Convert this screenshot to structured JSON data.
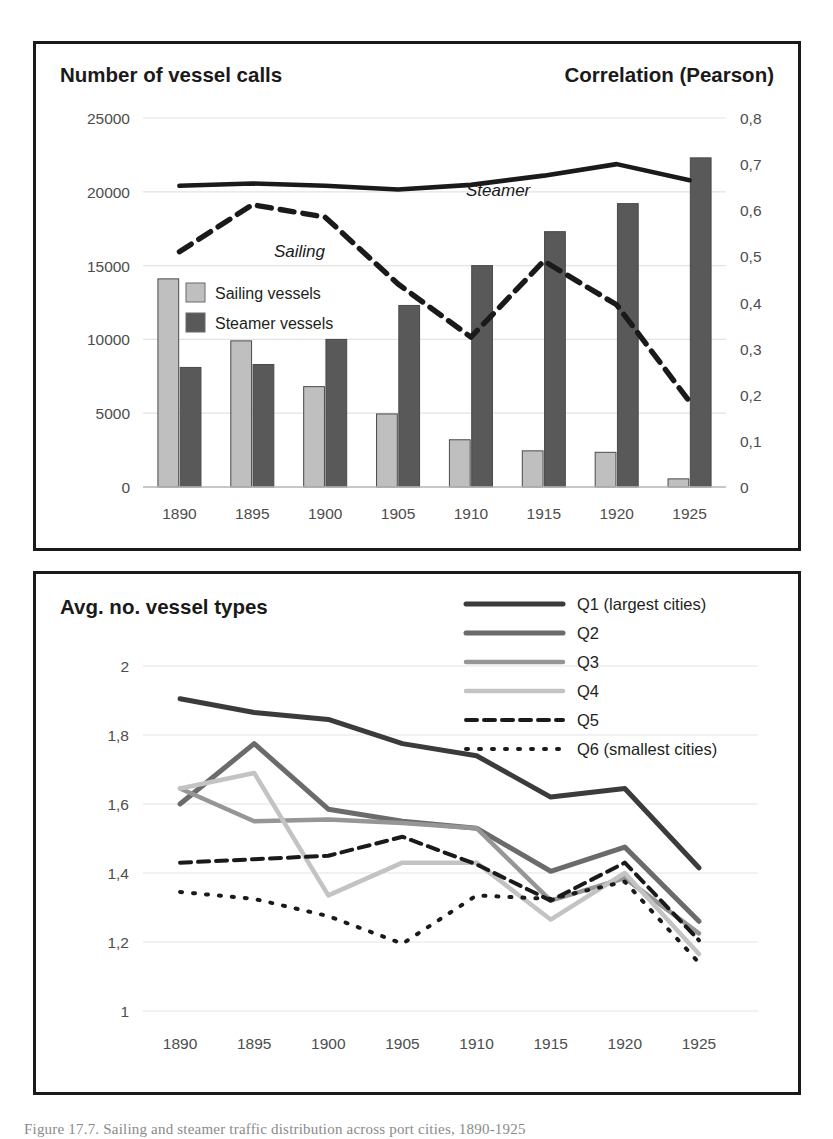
{
  "figure": {
    "caption": "Figure 17.7. Sailing and steamer traffic distribution across port cities, 1890-1925"
  },
  "panel_top": {
    "title_left": "Number of vessel calls",
    "title_right": "Correlation (Pearson)",
    "legend": [
      {
        "label": "Sailing vessels",
        "color": "#bfbfbf"
      },
      {
        "label": "Steamer vessels",
        "color": "#595959"
      }
    ],
    "annotations": [
      {
        "label": "Steamer"
      },
      {
        "label": "Sailing"
      }
    ]
  },
  "panel_bottom": {
    "title": "Avg. no. vessel types",
    "legend": [
      {
        "label": "Q1 (largest cities)",
        "color": "#3b3b3b",
        "dash": "none",
        "width": 5
      },
      {
        "label": "Q2",
        "color": "#6b6b6b",
        "dash": "none",
        "width": 5
      },
      {
        "label": "Q3",
        "color": "#969696",
        "dash": "none",
        "width": 4.5
      },
      {
        "label": "Q4",
        "color": "#c3c3c3",
        "dash": "none",
        "width": 4.5
      },
      {
        "label": "Q5",
        "color": "#1a1a1a",
        "dash": "11,7",
        "width": 4
      },
      {
        "label": "Q6 (smallest cities)",
        "color": "#1a1a1a",
        "dash": "2,11",
        "width": 4
      }
    ]
  },
  "chart_data": [
    {
      "type": "bar",
      "title": "Number of vessel calls / Correlation (Pearson)",
      "xlabel": "",
      "ylabel": "Number of vessel calls",
      "y2label": "Correlation (Pearson)",
      "categories": [
        "1890",
        "1895",
        "1900",
        "1905",
        "1910",
        "1915",
        "1920",
        "1925"
      ],
      "ylim": [
        0,
        25000
      ],
      "yticks": [
        "0",
        "5000",
        "10000",
        "15000",
        "20000",
        "25000"
      ],
      "ytick_values": [
        0,
        5000,
        10000,
        15000,
        20000,
        25000
      ],
      "y2lim": [
        0,
        0.8
      ],
      "y2ticks": [
        "0",
        "0,1",
        "0,2",
        "0,3",
        "0,4",
        "0,5",
        "0,6",
        "0,7",
        "0,8"
      ],
      "y2tick_values": [
        0,
        0.1,
        0.2,
        0.3,
        0.4,
        0.5,
        0.6,
        0.7,
        0.8
      ],
      "grid": true,
      "legend_position": "inside-upper-left",
      "series": [
        {
          "name": "Sailing vessels",
          "kind": "bar",
          "axis": "left",
          "color": "#bfbfbf",
          "values": [
            14100,
            9900,
            6800,
            4950,
            3200,
            2450,
            2350,
            550
          ]
        },
        {
          "name": "Steamer vessels",
          "kind": "bar",
          "axis": "left",
          "color": "#595959",
          "values": [
            8100,
            8300,
            10000,
            12300,
            15000,
            17300,
            19200,
            22300
          ]
        },
        {
          "name": "Steamer",
          "kind": "line",
          "axis": "right",
          "color": "#1a1a1a",
          "dash": "none",
          "values": [
            0.653,
            0.658,
            0.653,
            0.645,
            0.655,
            0.675,
            0.7,
            0.665
          ]
        },
        {
          "name": "Sailing",
          "kind": "line",
          "axis": "right",
          "color": "#1a1a1a",
          "dash": "14,9",
          "values": [
            0.51,
            0.612,
            0.585,
            0.44,
            0.325,
            0.49,
            0.395,
            0.185
          ]
        }
      ]
    },
    {
      "type": "line",
      "title": "Avg. no. vessel types",
      "xlabel": "",
      "ylabel": "Avg. no. vessel types",
      "categories": [
        "1890",
        "1895",
        "1900",
        "1905",
        "1910",
        "1915",
        "1920",
        "1925"
      ],
      "ylim": [
        1,
        2
      ],
      "yticks": [
        "1",
        "1,2",
        "1,4",
        "1,6",
        "1,8",
        "2"
      ],
      "ytick_values": [
        1,
        1.2,
        1.4,
        1.6,
        1.8,
        2
      ],
      "grid": true,
      "legend_position": "top-right",
      "series": [
        {
          "name": "Q1 (largest cities)",
          "color": "#3b3b3b",
          "dash": "none",
          "width": 5,
          "values": [
            1.905,
            1.865,
            1.845,
            1.775,
            1.74,
            1.62,
            1.645,
            1.415
          ]
        },
        {
          "name": "Q2",
          "color": "#6b6b6b",
          "dash": "none",
          "width": 5,
          "values": [
            1.6,
            1.775,
            1.585,
            1.55,
            1.53,
            1.405,
            1.475,
            1.26
          ]
        },
        {
          "name": "Q3",
          "color": "#969696",
          "dash": "none",
          "width": 4.5,
          "values": [
            1.645,
            1.55,
            1.555,
            1.545,
            1.53,
            1.32,
            1.385,
            1.225
          ]
        },
        {
          "name": "Q4",
          "color": "#c3c3c3",
          "dash": "none",
          "width": 4.5,
          "values": [
            1.645,
            1.69,
            1.335,
            1.43,
            1.43,
            1.265,
            1.4,
            1.165
          ]
        },
        {
          "name": "Q5",
          "color": "#1a1a1a",
          "dash": "11,7",
          "width": 4,
          "values": [
            1.43,
            1.44,
            1.45,
            1.505,
            1.425,
            1.32,
            1.43,
            1.205
          ]
        },
        {
          "name": "Q6 (smallest cities)",
          "color": "#1a1a1a",
          "dash": "2,11",
          "width": 4,
          "values": [
            1.345,
            1.325,
            1.275,
            1.195,
            1.335,
            1.325,
            1.375,
            1.14
          ]
        }
      ]
    }
  ]
}
